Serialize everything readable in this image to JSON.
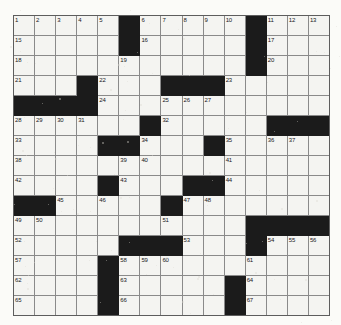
{
  "puzzle": {
    "type": "crossword-grid",
    "columns": 15,
    "rows": 14,
    "colors": {
      "block": "#1b1b1b",
      "cell": "#f4f4f1",
      "grid_line": "#8a8a8a",
      "number_text": "#17171a",
      "page_background": "#fbfbf8"
    },
    "highest_clue_number": 67,
    "grid": [
      {
        "row": 0,
        "cells": [
          {
            "type": "open",
            "number": "1"
          },
          {
            "type": "open",
            "number": "2"
          },
          {
            "type": "open",
            "number": "3"
          },
          {
            "type": "open",
            "number": "4"
          },
          {
            "type": "open",
            "number": "5"
          },
          {
            "type": "block",
            "number": ""
          },
          {
            "type": "open",
            "number": "6"
          },
          {
            "type": "open",
            "number": "7"
          },
          {
            "type": "open",
            "number": "8"
          },
          {
            "type": "open",
            "number": "9"
          },
          {
            "type": "open",
            "number": "10"
          },
          {
            "type": "block",
            "number": ""
          },
          {
            "type": "open",
            "number": "11"
          },
          {
            "type": "open",
            "number": "12"
          },
          {
            "type": "open",
            "number": "13"
          }
        ]
      },
      {
        "row": 1,
        "cells": [
          {
            "type": "open",
            "number": "15"
          },
          {
            "type": "open",
            "number": ""
          },
          {
            "type": "open",
            "number": ""
          },
          {
            "type": "open",
            "number": ""
          },
          {
            "type": "open",
            "number": ""
          },
          {
            "type": "block",
            "number": ""
          },
          {
            "type": "open",
            "number": "16"
          },
          {
            "type": "open",
            "number": ""
          },
          {
            "type": "open",
            "number": ""
          },
          {
            "type": "open",
            "number": ""
          },
          {
            "type": "open",
            "number": ""
          },
          {
            "type": "block",
            "number": ""
          },
          {
            "type": "open",
            "number": "17"
          },
          {
            "type": "open",
            "number": ""
          },
          {
            "type": "open",
            "number": ""
          }
        ]
      },
      {
        "row": 2,
        "cells": [
          {
            "type": "open",
            "number": "18"
          },
          {
            "type": "open",
            "number": ""
          },
          {
            "type": "open",
            "number": ""
          },
          {
            "type": "open",
            "number": ""
          },
          {
            "type": "open",
            "number": ""
          },
          {
            "type": "open",
            "number": "19"
          },
          {
            "type": "open",
            "number": ""
          },
          {
            "type": "open",
            "number": ""
          },
          {
            "type": "open",
            "number": ""
          },
          {
            "type": "open",
            "number": ""
          },
          {
            "type": "open",
            "number": ""
          },
          {
            "type": "block",
            "number": ""
          },
          {
            "type": "open",
            "number": "20"
          },
          {
            "type": "open",
            "number": ""
          },
          {
            "type": "open",
            "number": ""
          }
        ]
      },
      {
        "row": 3,
        "cells": [
          {
            "type": "open",
            "number": "21"
          },
          {
            "type": "open",
            "number": ""
          },
          {
            "type": "open",
            "number": ""
          },
          {
            "type": "block",
            "number": ""
          },
          {
            "type": "open",
            "number": "22"
          },
          {
            "type": "open",
            "number": ""
          },
          {
            "type": "open",
            "number": ""
          },
          {
            "type": "block",
            "number": ""
          },
          {
            "type": "block",
            "number": ""
          },
          {
            "type": "block",
            "number": ""
          },
          {
            "type": "open",
            "number": "23"
          },
          {
            "type": "open",
            "number": ""
          },
          {
            "type": "open",
            "number": ""
          },
          {
            "type": "open",
            "number": ""
          },
          {
            "type": "open",
            "number": ""
          }
        ]
      },
      {
        "row": 4,
        "cells": [
          {
            "type": "block",
            "number": ""
          },
          {
            "type": "block",
            "number": ""
          },
          {
            "type": "block",
            "number": ""
          },
          {
            "type": "block",
            "number": ""
          },
          {
            "type": "open",
            "number": "24"
          },
          {
            "type": "open",
            "number": ""
          },
          {
            "type": "open",
            "number": ""
          },
          {
            "type": "open",
            "number": "25"
          },
          {
            "type": "open",
            "number": "26"
          },
          {
            "type": "open",
            "number": "27"
          },
          {
            "type": "open",
            "number": ""
          },
          {
            "type": "open",
            "number": ""
          },
          {
            "type": "open",
            "number": ""
          },
          {
            "type": "open",
            "number": ""
          },
          {
            "type": "open",
            "number": ""
          }
        ]
      },
      {
        "row": 5,
        "cells": [
          {
            "type": "open",
            "number": "28"
          },
          {
            "type": "open",
            "number": "29"
          },
          {
            "type": "open",
            "number": "30"
          },
          {
            "type": "open",
            "number": "31"
          },
          {
            "type": "open",
            "number": ""
          },
          {
            "type": "open",
            "number": ""
          },
          {
            "type": "block",
            "number": ""
          },
          {
            "type": "open",
            "number": "32"
          },
          {
            "type": "open",
            "number": ""
          },
          {
            "type": "open",
            "number": ""
          },
          {
            "type": "open",
            "number": ""
          },
          {
            "type": "open",
            "number": ""
          },
          {
            "type": "block",
            "number": ""
          },
          {
            "type": "block",
            "number": ""
          },
          {
            "type": "block",
            "number": ""
          }
        ]
      },
      {
        "row": 6,
        "cells": [
          {
            "type": "open",
            "number": "33"
          },
          {
            "type": "open",
            "number": ""
          },
          {
            "type": "open",
            "number": ""
          },
          {
            "type": "open",
            "number": ""
          },
          {
            "type": "block",
            "number": ""
          },
          {
            "type": "block",
            "number": ""
          },
          {
            "type": "open",
            "number": "34"
          },
          {
            "type": "open",
            "number": ""
          },
          {
            "type": "open",
            "number": ""
          },
          {
            "type": "block",
            "number": ""
          },
          {
            "type": "open",
            "number": "35"
          },
          {
            "type": "open",
            "number": ""
          },
          {
            "type": "open",
            "number": "36"
          },
          {
            "type": "open",
            "number": "37"
          },
          {
            "type": "open",
            "number": ""
          }
        ]
      },
      {
        "row": 7,
        "cells": [
          {
            "type": "open",
            "number": "38"
          },
          {
            "type": "open",
            "number": ""
          },
          {
            "type": "open",
            "number": ""
          },
          {
            "type": "open",
            "number": ""
          },
          {
            "type": "open",
            "number": ""
          },
          {
            "type": "open",
            "number": "39"
          },
          {
            "type": "open",
            "number": "40"
          },
          {
            "type": "open",
            "number": ""
          },
          {
            "type": "open",
            "number": ""
          },
          {
            "type": "open",
            "number": ""
          },
          {
            "type": "open",
            "number": "41"
          },
          {
            "type": "open",
            "number": ""
          },
          {
            "type": "open",
            "number": ""
          },
          {
            "type": "open",
            "number": ""
          },
          {
            "type": "open",
            "number": ""
          }
        ]
      },
      {
        "row": 8,
        "cells": [
          {
            "type": "open",
            "number": "42"
          },
          {
            "type": "open",
            "number": ""
          },
          {
            "type": "open",
            "number": ""
          },
          {
            "type": "open",
            "number": ""
          },
          {
            "type": "block",
            "number": ""
          },
          {
            "type": "open",
            "number": "43"
          },
          {
            "type": "open",
            "number": ""
          },
          {
            "type": "open",
            "number": ""
          },
          {
            "type": "block",
            "number": ""
          },
          {
            "type": "block",
            "number": ""
          },
          {
            "type": "open",
            "number": "44"
          },
          {
            "type": "open",
            "number": ""
          },
          {
            "type": "open",
            "number": ""
          },
          {
            "type": "open",
            "number": ""
          },
          {
            "type": "open",
            "number": ""
          }
        ]
      },
      {
        "row": 9,
        "cells": [
          {
            "type": "block",
            "number": ""
          },
          {
            "type": "block",
            "number": ""
          },
          {
            "type": "open",
            "number": "45"
          },
          {
            "type": "open",
            "number": ""
          },
          {
            "type": "open",
            "number": "46"
          },
          {
            "type": "open",
            "number": ""
          },
          {
            "type": "open",
            "number": ""
          },
          {
            "type": "block",
            "number": ""
          },
          {
            "type": "open",
            "number": "47"
          },
          {
            "type": "open",
            "number": "48"
          },
          {
            "type": "open",
            "number": ""
          },
          {
            "type": "open",
            "number": ""
          },
          {
            "type": "open",
            "number": ""
          },
          {
            "type": "open",
            "number": ""
          },
          {
            "type": "open",
            "number": ""
          }
        ]
      },
      {
        "row": 10,
        "cells": [
          {
            "type": "open",
            "number": "49"
          },
          {
            "type": "open",
            "number": "50"
          },
          {
            "type": "open",
            "number": ""
          },
          {
            "type": "open",
            "number": ""
          },
          {
            "type": "open",
            "number": ""
          },
          {
            "type": "open",
            "number": ""
          },
          {
            "type": "open",
            "number": ""
          },
          {
            "type": "open",
            "number": "51"
          },
          {
            "type": "open",
            "number": ""
          },
          {
            "type": "open",
            "number": ""
          },
          {
            "type": "open",
            "number": ""
          },
          {
            "type": "block",
            "number": ""
          },
          {
            "type": "block",
            "number": ""
          },
          {
            "type": "block",
            "number": ""
          },
          {
            "type": "block",
            "number": ""
          }
        ]
      },
      {
        "row": 11,
        "cells": [
          {
            "type": "open",
            "number": "52"
          },
          {
            "type": "open",
            "number": ""
          },
          {
            "type": "open",
            "number": ""
          },
          {
            "type": "open",
            "number": ""
          },
          {
            "type": "open",
            "number": ""
          },
          {
            "type": "block",
            "number": ""
          },
          {
            "type": "block",
            "number": ""
          },
          {
            "type": "block",
            "number": ""
          },
          {
            "type": "open",
            "number": "53"
          },
          {
            "type": "open",
            "number": ""
          },
          {
            "type": "open",
            "number": ""
          },
          {
            "type": "block",
            "number": ""
          },
          {
            "type": "open",
            "number": "54"
          },
          {
            "type": "open",
            "number": "55"
          },
          {
            "type": "open",
            "number": "56"
          }
        ]
      },
      {
        "row": 12,
        "cells": [
          {
            "type": "open",
            "number": "57"
          },
          {
            "type": "open",
            "number": ""
          },
          {
            "type": "open",
            "number": ""
          },
          {
            "type": "open",
            "number": ""
          },
          {
            "type": "block",
            "number": ""
          },
          {
            "type": "open",
            "number": "58"
          },
          {
            "type": "open",
            "number": "59"
          },
          {
            "type": "open",
            "number": "60"
          },
          {
            "type": "open",
            "number": ""
          },
          {
            "type": "open",
            "number": ""
          },
          {
            "type": "open",
            "number": ""
          },
          {
            "type": "open",
            "number": "61"
          },
          {
            "type": "open",
            "number": ""
          },
          {
            "type": "open",
            "number": ""
          },
          {
            "type": "open",
            "number": ""
          }
        ]
      },
      {
        "row": 13,
        "cells": [
          {
            "type": "open",
            "number": "62"
          },
          {
            "type": "open",
            "number": ""
          },
          {
            "type": "open",
            "number": ""
          },
          {
            "type": "open",
            "number": ""
          },
          {
            "type": "block",
            "number": ""
          },
          {
            "type": "open",
            "number": "63"
          },
          {
            "type": "open",
            "number": ""
          },
          {
            "type": "open",
            "number": ""
          },
          {
            "type": "open",
            "number": ""
          },
          {
            "type": "open",
            "number": ""
          },
          {
            "type": "block",
            "number": ""
          },
          {
            "type": "open",
            "number": "64"
          },
          {
            "type": "open",
            "number": ""
          },
          {
            "type": "open",
            "number": ""
          },
          {
            "type": "open",
            "number": ""
          }
        ]
      },
      {
        "row": 14,
        "cells": [
          {
            "type": "open",
            "number": "65"
          },
          {
            "type": "open",
            "number": ""
          },
          {
            "type": "open",
            "number": ""
          },
          {
            "type": "open",
            "number": ""
          },
          {
            "type": "block",
            "number": ""
          },
          {
            "type": "open",
            "number": "66"
          },
          {
            "type": "open",
            "number": ""
          },
          {
            "type": "open",
            "number": ""
          },
          {
            "type": "open",
            "number": ""
          },
          {
            "type": "open",
            "number": ""
          },
          {
            "type": "block",
            "number": ""
          },
          {
            "type": "open",
            "number": "67"
          },
          {
            "type": "open",
            "number": ""
          },
          {
            "type": "open",
            "number": ""
          },
          {
            "type": "open",
            "number": ""
          }
        ]
      }
    ]
  }
}
